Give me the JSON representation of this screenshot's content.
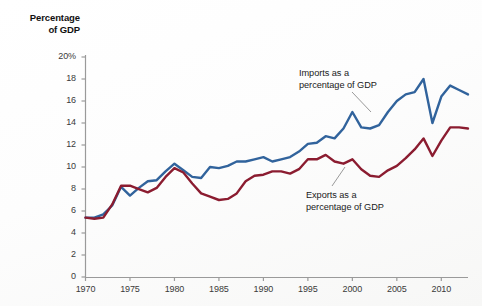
{
  "chart_data": {
    "type": "line",
    "title": "",
    "ylabel": "Percentage of GDP",
    "xlabel": "",
    "ylim": [
      0,
      20
    ],
    "xlim": [
      1970,
      2013
    ],
    "grid": false,
    "legend_position": "inline-annotations",
    "y_tick_labels": [
      "20%",
      "18",
      "16",
      "14",
      "12",
      "10",
      "8",
      "6",
      "4",
      "2",
      "0"
    ],
    "y_ticks": [
      20,
      18,
      16,
      14,
      12,
      10,
      8,
      6,
      4,
      2,
      0
    ],
    "x_tick_labels": [
      "1970",
      "1975",
      "1980",
      "1985",
      "1990",
      "1995",
      "2000",
      "2005",
      "2010"
    ],
    "x_ticks": [
      1970,
      1975,
      1980,
      1985,
      1990,
      1995,
      2000,
      2005,
      2010
    ],
    "x": [
      1970,
      1971,
      1972,
      1973,
      1974,
      1975,
      1976,
      1977,
      1978,
      1979,
      1980,
      1981,
      1982,
      1983,
      1984,
      1985,
      1986,
      1987,
      1988,
      1989,
      1990,
      1991,
      1992,
      1993,
      1994,
      1995,
      1996,
      1997,
      1998,
      1999,
      2000,
      2001,
      2002,
      2003,
      2004,
      2005,
      2006,
      2007,
      2008,
      2009,
      2010,
      2011,
      2012,
      2013
    ],
    "series": [
      {
        "name": "Imports as a percentage of GDP",
        "color": "#31639c",
        "values": [
          5.4,
          5.4,
          5.7,
          6.5,
          8.2,
          7.4,
          8.1,
          8.7,
          8.8,
          9.6,
          10.3,
          9.7,
          9.1,
          9.0,
          10.0,
          9.9,
          10.1,
          10.5,
          10.5,
          10.7,
          10.9,
          10.5,
          10.7,
          10.9,
          11.4,
          12.1,
          12.2,
          12.8,
          12.6,
          13.5,
          15.0,
          13.6,
          13.5,
          13.8,
          15.0,
          16.0,
          16.6,
          16.8,
          18.0,
          14.0,
          16.4,
          17.4,
          17.0,
          16.6
        ]
      },
      {
        "name": "Exports as a percentage of GDP",
        "color": "#8b1c30",
        "values": [
          5.4,
          5.3,
          5.4,
          6.6,
          8.3,
          8.3,
          8.0,
          7.7,
          8.1,
          9.1,
          9.9,
          9.5,
          8.5,
          7.6,
          7.3,
          7.0,
          7.1,
          7.6,
          8.7,
          9.2,
          9.3,
          9.6,
          9.6,
          9.4,
          9.8,
          10.7,
          10.7,
          11.1,
          10.5,
          10.3,
          10.7,
          9.8,
          9.2,
          9.1,
          9.7,
          10.1,
          10.8,
          11.6,
          12.6,
          11.0,
          12.4,
          13.6,
          13.6,
          13.5
        ]
      }
    ],
    "annotations": [
      {
        "id": "imports",
        "line1": "Imports as a",
        "line2": "percentage of GDP"
      },
      {
        "id": "exports",
        "line1": "Exports as a",
        "line2": "percentage of GDP"
      }
    ]
  },
  "axis": {
    "title_line1": "Percentage",
    "title_line2": "of GDP"
  }
}
